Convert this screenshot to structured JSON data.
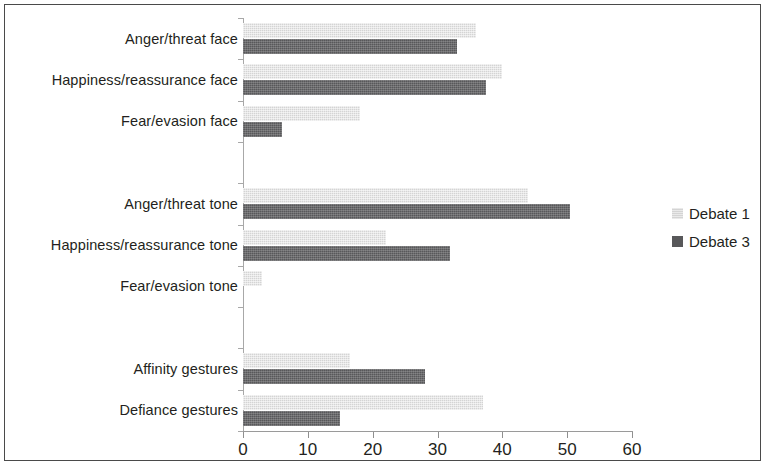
{
  "chart_data": {
    "type": "bar",
    "orientation": "horizontal",
    "title": "",
    "subtitle": "",
    "xlabel": "",
    "ylabel": "",
    "xlim": [
      0,
      60
    ],
    "xticks": [
      0,
      10,
      20,
      30,
      40,
      50,
      60
    ],
    "xtick_labels": [
      "0",
      "10",
      "20",
      "30",
      "40",
      "50",
      "60"
    ],
    "grid": false,
    "legend_position": "right",
    "categories": [
      "Anger/threat face",
      "Happiness/reassurance face",
      "Fear/evasion face",
      "",
      "Anger/threat tone",
      "Happiness/reassurance tone",
      "Fear/evasion tone",
      "",
      "Affinity gestures",
      "Defiance gestures"
    ],
    "series": [
      {
        "name": "Debate 1",
        "color": "#d4d4d4",
        "values": [
          36,
          40,
          18,
          null,
          44,
          22,
          3,
          null,
          16.5,
          37
        ]
      },
      {
        "name": "Debate 3",
        "color": "#58585a",
        "values": [
          33,
          37.5,
          6,
          null,
          50.5,
          32,
          0,
          null,
          28,
          15
        ]
      }
    ]
  },
  "legend": {
    "items": [
      {
        "label": "Debate 1"
      },
      {
        "label": "Debate 3"
      }
    ]
  },
  "colors": {
    "series_1": "#d4d4d4",
    "series_3": "#58585a",
    "axis": "#9a9a9a",
    "text": "#231f20",
    "frame": "#4a4a4a",
    "background": "#ffffff"
  }
}
